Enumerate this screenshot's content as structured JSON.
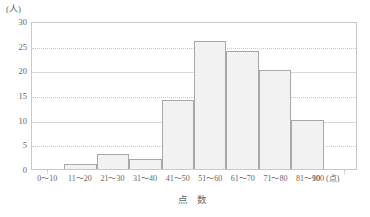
{
  "chart_data": {
    "type": "bar",
    "title": "",
    "subtitle": "",
    "xlabel": "点 数",
    "ylabel": "",
    "y_unit_label": "(人)",
    "x_unit_label": "(点)",
    "x_end_tick": "100",
    "categories": [
      "0〜10",
      "11〜20",
      "21〜30",
      "31〜40",
      "41〜50",
      "51〜60",
      "61〜70",
      "71〜80",
      "81〜90"
    ],
    "values": [
      0,
      1,
      3,
      2,
      14,
      26,
      24,
      20,
      10
    ],
    "ylim": [
      0,
      30
    ],
    "ytick_labels": [
      "0",
      "5",
      "10",
      "15",
      "20",
      "25",
      "30"
    ],
    "ytick_values": [
      0,
      5,
      10,
      15,
      20,
      25,
      30
    ],
    "grid": true,
    "grid_style": "dotted-horizontal",
    "legend": null,
    "colors": {
      "bar_fill": "#f2f2f2",
      "bar_stroke": "#a8a8a8",
      "grid": "#c9c9c9",
      "axis": "#c9c9c9",
      "text": "#666666"
    }
  }
}
